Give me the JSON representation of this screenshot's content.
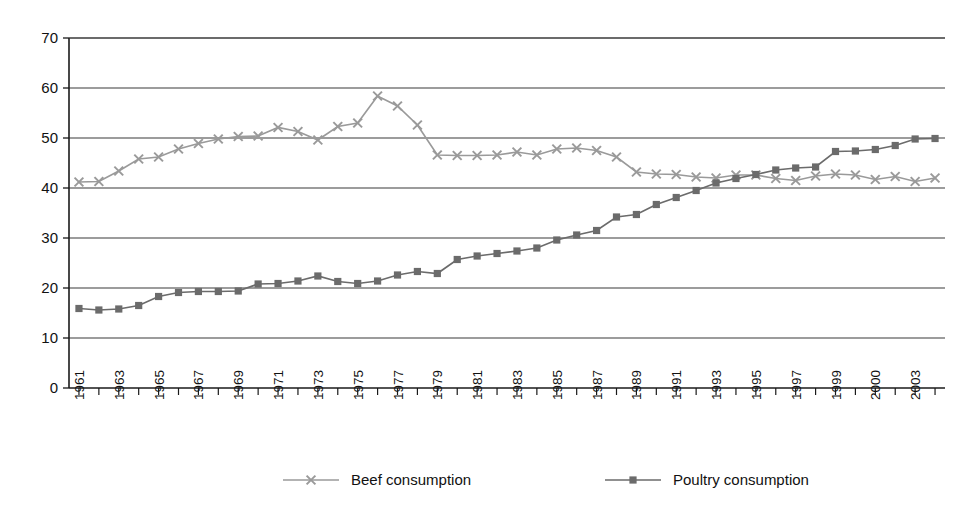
{
  "chart_data": {
    "type": "line",
    "title": "",
    "subtitle": "",
    "xlabel": "",
    "ylabel": "",
    "xlim": [
      1960.5,
      2004.5
    ],
    "ylim": [
      0,
      70
    ],
    "yticks": [
      0,
      10,
      20,
      30,
      40,
      50,
      60,
      70
    ],
    "grid": "horizontal",
    "legend_position": "bottom",
    "x": [
      1961,
      1962,
      1963,
      1964,
      1965,
      1966,
      1967,
      1968,
      1969,
      1970,
      1971,
      1972,
      1973,
      1974,
      1975,
      1976,
      1977,
      1978,
      1979,
      1980,
      1981,
      1982,
      1983,
      1984,
      1985,
      1986,
      1987,
      1988,
      1989,
      1990,
      1991,
      1992,
      1993,
      1994,
      1995,
      1996,
      1997,
      1998,
      1999,
      2000,
      2001,
      2002,
      2003,
      2004
    ],
    "xtick_labels": [
      "1961",
      "",
      "1963",
      "",
      "1965",
      "",
      "1967",
      "",
      "1969",
      "",
      "1971",
      "",
      "1973",
      "",
      "1975",
      "",
      "1977",
      "",
      "1979",
      "",
      "1981",
      "",
      "1983",
      "",
      "1985",
      "",
      "1987",
      "",
      "1989",
      "",
      "1991",
      "",
      "1993",
      "",
      "1995",
      "",
      "1997",
      "",
      "1999",
      "",
      "2000",
      "",
      "2003",
      ""
    ],
    "xtick_labels_visible": [
      "1961",
      "1963",
      "1965",
      "1967",
      "1969",
      "1971",
      "1973",
      "1975",
      "1977",
      "1979",
      "1981",
      "1983",
      "1985",
      "1987",
      "1989",
      "1991",
      "1993",
      "1995",
      "1997",
      "1999",
      "2000",
      "2003"
    ],
    "series": [
      {
        "name": "Beef consumption",
        "marker": "x",
        "color": "#9a9a9a",
        "values": [
          41.2,
          41.3,
          43.4,
          45.8,
          46.2,
          47.8,
          48.9,
          49.8,
          50.3,
          50.4,
          52.1,
          51.3,
          49.6,
          52.3,
          53.0,
          58.4,
          56.4,
          52.6,
          46.6,
          46.5,
          46.5,
          46.6,
          47.2,
          46.6,
          47.8,
          48.0,
          47.5,
          46.2,
          43.2,
          42.8,
          42.7,
          42.2,
          42.0,
          42.6,
          42.6,
          41.9,
          41.5,
          42.4,
          42.8,
          42.6,
          41.7,
          42.3,
          41.3,
          42.0
        ],
        "start_value": 41.2,
        "peak_value": 58.4,
        "peak_year": 1976,
        "end_value": 42.0
      },
      {
        "name": "Poultry consumption",
        "marker": "square",
        "color": "#6b6b6b",
        "values": [
          15.9,
          15.6,
          15.8,
          16.5,
          18.3,
          19.1,
          19.3,
          19.3,
          19.4,
          20.8,
          20.9,
          21.4,
          22.4,
          21.3,
          20.9,
          21.4,
          22.6,
          23.3,
          22.9,
          25.7,
          26.4,
          26.9,
          27.4,
          28.0,
          29.6,
          30.6,
          31.5,
          34.2,
          34.7,
          36.7,
          38.1,
          39.5,
          41.0,
          41.9,
          42.7,
          43.6,
          44.0,
          44.2,
          47.3,
          47.4,
          47.7,
          48.5,
          49.8,
          49.9
        ],
        "start_value": 15.9,
        "end_value": 49.9
      }
    ]
  },
  "legend": {
    "items": [
      {
        "label": "Beef consumption",
        "marker": "x-marker",
        "color": "#9a9a9a"
      },
      {
        "label": "Poultry consumption",
        "marker": "square-marker",
        "color": "#6b6b6b"
      }
    ]
  },
  "colors": {
    "background": "#ffffff",
    "axis": "#1a1a1a",
    "grid": "#3a3a3a",
    "beef": "#9a9a9a",
    "poultry": "#6b6b6b"
  }
}
